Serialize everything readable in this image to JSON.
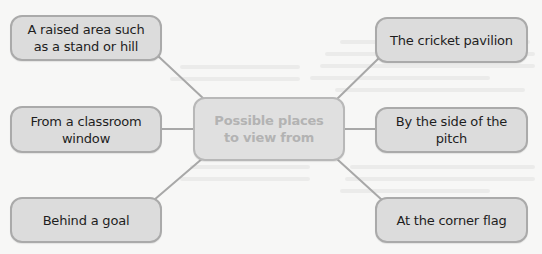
{
  "diagram": {
    "type": "mind-map",
    "center": {
      "label": "Possible places to view from"
    },
    "nodes": [
      {
        "id": "top-left",
        "label": "A raised area such as a stand or hill"
      },
      {
        "id": "middle-left",
        "label": "From a classroom window"
      },
      {
        "id": "bottom-left",
        "label": "Behind a goal"
      },
      {
        "id": "top-right",
        "label": "The cricket pavilion"
      },
      {
        "id": "middle-right",
        "label": "By the side of the pitch"
      },
      {
        "id": "bottom-right",
        "label": "At the corner flag"
      }
    ],
    "colors": {
      "background": "#f7f7f6",
      "node_fill": "#dcdcdc",
      "node_border": "#aaaaaa",
      "connector": "#a8a8a8",
      "node_text": "#1e1e1e",
      "center_text": "#b3b3b3"
    }
  }
}
